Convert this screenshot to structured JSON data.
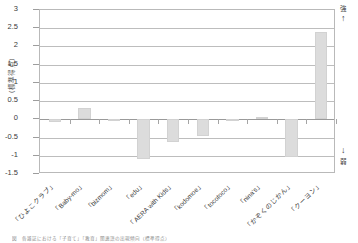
{
  "chart_data": {
    "type": "bar",
    "title": "",
    "xlabel": "",
    "ylabel": "（標準得点）",
    "ylim": [
      -1.5,
      3
    ],
    "yticks": [
      "3",
      "2.5",
      "2",
      "1.5",
      "1",
      "0.5",
      "0",
      "-0.5",
      "-1",
      "-1.5"
    ],
    "ytick_values": [
      3,
      2.5,
      2,
      1.5,
      1,
      0.5,
      0,
      -0.5,
      -1,
      -1.5
    ],
    "grid": true,
    "legend": "none",
    "categories": [
      "「ひよこクラブ」",
      "「Baby-mo」",
      "「bizmom」",
      "「edu」",
      "「AERA with Kids」",
      "「kodomoe」",
      "「tocotoco」",
      "「nina's」",
      "「かぞくのじかん」",
      "「クーヨン」"
    ],
    "values": [
      -0.08,
      0.3,
      -0.01,
      -1.1,
      -0.62,
      -0.45,
      -0.03,
      0.07,
      -1.02,
      2.4
    ],
    "bar_color": "#dcdcdc",
    "annotations": {
      "top_right_label": "強",
      "top_right_arrow": "↑",
      "bottom_right_arrow": "↓",
      "bottom_right_label": "弱"
    }
  },
  "caption": "図　各雑誌における「子育て」「教育」関連語の出現傾向（標準得点）",
  "axis": {
    "y_title": "（標準得点）"
  }
}
